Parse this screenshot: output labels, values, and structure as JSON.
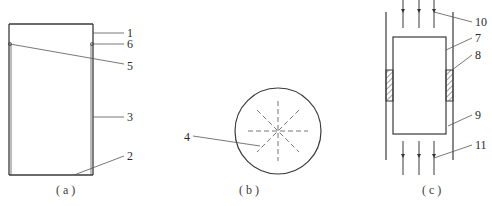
{
  "figure": {
    "panels": [
      {
        "id": "a",
        "caption": "( a )",
        "labels": [
          {
            "text": "1",
            "part": "top-section"
          },
          {
            "text": "6",
            "part": "notch"
          },
          {
            "text": "5",
            "part": "notch-left"
          },
          {
            "text": "3",
            "part": "side-wall"
          },
          {
            "text": "2",
            "part": "bottom"
          }
        ]
      },
      {
        "id": "b",
        "caption": "( b )",
        "labels": [
          {
            "text": "4",
            "part": "radial-dashed-lines"
          }
        ]
      },
      {
        "id": "c",
        "caption": "( c )",
        "labels": [
          {
            "text": "10",
            "part": "inflow-arrows"
          },
          {
            "text": "7",
            "part": "inner-block"
          },
          {
            "text": "8",
            "part": "hatched-seal"
          },
          {
            "text": "9",
            "part": "outer-channel"
          },
          {
            "text": "11",
            "part": "outflow-arrows"
          }
        ]
      }
    ],
    "colors": {
      "line": "#3a3a3a",
      "text": "#2a2a2a",
      "background": "#ffffff"
    }
  }
}
